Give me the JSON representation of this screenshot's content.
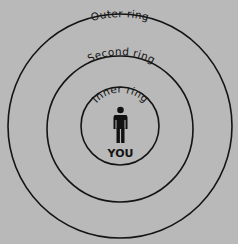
{
  "diagram": {
    "title": "",
    "background_color": "#b9b9b9",
    "line_color": "#141414",
    "center": {
      "x": 120,
      "y": 127
    },
    "rings": [
      {
        "id": "outer",
        "label": "Outer ring",
        "radius": 112
      },
      {
        "id": "second",
        "label": "Second ring",
        "radius": 73
      },
      {
        "id": "inner",
        "label": "Inner ring",
        "radius": 39
      }
    ],
    "center_figure": {
      "icon": "person-icon",
      "label": "YOU"
    }
  }
}
